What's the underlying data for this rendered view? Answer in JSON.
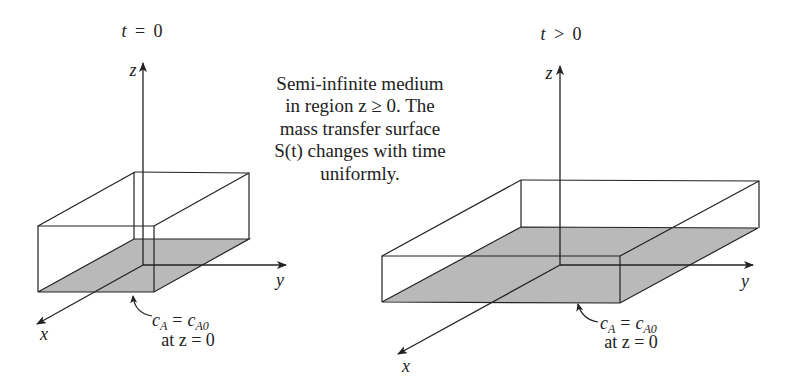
{
  "panels": [
    {
      "id": "initial",
      "time_label": {
        "var": "t",
        "rel": "=",
        "val": "0"
      },
      "axes": {
        "z": "z",
        "y": "y",
        "x": "x"
      },
      "surface_label": {
        "c": "c",
        "sub1": "A",
        "eq": "=",
        "sub2": "A0",
        "condition": "at z = 0"
      }
    },
    {
      "id": "later",
      "time_label": {
        "var": "t",
        "rel": ">",
        "val": "0"
      },
      "axes": {
        "z": "z",
        "y": "y",
        "x": "x"
      },
      "surface_label": {
        "c": "c",
        "sub1": "A",
        "eq": "=",
        "sub2": "A0",
        "condition": "at z = 0"
      }
    }
  ],
  "description": {
    "lines": [
      "Semi-infinite medium",
      "in region z ≥ 0. The",
      "mass transfer surface",
      "S(t) changes with time",
      "uniformly."
    ]
  },
  "colors": {
    "line": "#222222",
    "surface_fill": "#b9b9b9"
  }
}
